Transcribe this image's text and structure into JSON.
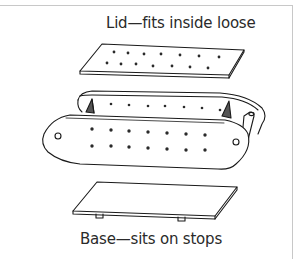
{
  "diagram": {
    "labels": {
      "lid": "Lid—fits inside loose",
      "base": "Base—sits on stops"
    },
    "parts": [
      {
        "name": "lid",
        "description": "Perforated flat panel",
        "hole_rows": 2,
        "holes_per_row": [
          7,
          7
        ]
      },
      {
        "name": "box-body",
        "description": "Two rounded-end side walls with perforations, end blocks and dowel",
        "front_hole_rows": 2,
        "front_holes_per_row": [
          7,
          7
        ],
        "back_holes": 6
      },
      {
        "name": "base",
        "description": "Flat panel resting on stops",
        "stops": 2
      }
    ],
    "colors": {
      "line": "#1a1a1a",
      "frame": "#c8c8c8",
      "background": "#ffffff"
    }
  }
}
